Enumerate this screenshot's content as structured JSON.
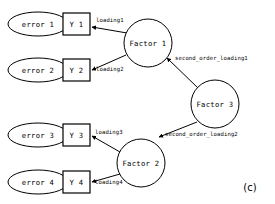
{
  "figure": {
    "panel_label": "(c)",
    "background_color": "#ffffff",
    "stroke_color": "#000000",
    "fill_color": "#ffffff"
  },
  "nodes": {
    "errors": [
      {
        "id": "error1",
        "label": "error 1",
        "shape": "ellipse",
        "cx": 38,
        "cy": 24,
        "rx": 30,
        "ry": 12
      },
      {
        "id": "error2",
        "label": "error 2",
        "shape": "ellipse",
        "cx": 38,
        "cy": 70,
        "rx": 30,
        "ry": 12
      },
      {
        "id": "error3",
        "label": "error 3",
        "shape": "ellipse",
        "cx": 38,
        "cy": 135,
        "rx": 30,
        "ry": 12
      },
      {
        "id": "error4",
        "label": "error 4",
        "shape": "ellipse",
        "cx": 38,
        "cy": 182,
        "rx": 30,
        "ry": 12
      }
    ],
    "indicators": [
      {
        "id": "y1",
        "label": "Y 1",
        "shape": "rect",
        "x": 63,
        "y": 13,
        "w": 27,
        "h": 22
      },
      {
        "id": "y2",
        "label": "Y 2",
        "shape": "rect",
        "x": 63,
        "y": 59,
        "w": 27,
        "h": 22
      },
      {
        "id": "y3",
        "label": "Y 3",
        "shape": "rect",
        "x": 63,
        "y": 124,
        "w": 27,
        "h": 22
      },
      {
        "id": "y4",
        "label": "Y 4",
        "shape": "rect",
        "x": 63,
        "y": 171,
        "w": 27,
        "h": 22
      }
    ],
    "factors": [
      {
        "id": "factor1",
        "label": "Factor 1",
        "shape": "circle",
        "cx": 148,
        "cy": 43,
        "r": 24
      },
      {
        "id": "factor2",
        "label": "Factor 2",
        "shape": "circle",
        "cx": 141,
        "cy": 163,
        "r": 24
      },
      {
        "id": "factor3",
        "label": "Factor 3",
        "shape": "circle",
        "cx": 215,
        "cy": 104,
        "r": 24
      }
    ]
  },
  "edges": [
    {
      "id": "e-err1-y1",
      "from": "error1",
      "to": "y1",
      "label": "",
      "x1": 68,
      "y1": 24,
      "x2": 62,
      "y2": 24
    },
    {
      "id": "e-err2-y2",
      "from": "error2",
      "to": "y2",
      "label": "",
      "x1": 68,
      "y1": 70,
      "x2": 62,
      "y2": 70
    },
    {
      "id": "e-err3-y3",
      "from": "error3",
      "to": "y3",
      "label": "",
      "x1": 68,
      "y1": 135,
      "x2": 62,
      "y2": 135
    },
    {
      "id": "e-err4-y4",
      "from": "error4",
      "to": "y4",
      "label": "",
      "x1": 68,
      "y1": 182,
      "x2": 62,
      "y2": 182
    },
    {
      "id": "e-f1-y1",
      "from": "factor1",
      "to": "y1",
      "label": "loading1",
      "x1": 127,
      "y1": 33,
      "x2": 92,
      "y2": 27,
      "lx": 96,
      "ly": 20
    },
    {
      "id": "e-f1-y2",
      "from": "factor1",
      "to": "y2",
      "label": "loading2",
      "x1": 126,
      "y1": 55,
      "x2": 92,
      "y2": 70,
      "lx": 96,
      "ly": 69
    },
    {
      "id": "e-f2-y3",
      "from": "factor2",
      "to": "y3",
      "label": "loading3",
      "x1": 120,
      "y1": 152,
      "x2": 92,
      "y2": 136,
      "lx": 95,
      "ly": 132
    },
    {
      "id": "e-f2-y4",
      "from": "factor2",
      "to": "y4",
      "label": "loading4",
      "x1": 120,
      "y1": 174,
      "x2": 92,
      "y2": 182,
      "lx": 95,
      "ly": 182
    },
    {
      "id": "e-f3-f1",
      "from": "factor3",
      "to": "factor1",
      "label": "second_order_loading1",
      "x1": 198,
      "y1": 88,
      "x2": 167,
      "y2": 58,
      "lx": 175,
      "ly": 58
    },
    {
      "id": "e-f3-f2",
      "from": "factor3",
      "to": "factor2",
      "label": "second_order_loading2",
      "x1": 197,
      "y1": 122,
      "x2": 159,
      "y2": 137,
      "lx": 165,
      "ly": 134
    }
  ],
  "panel": {
    "label": "(c)",
    "x": 250,
    "y": 187
  }
}
